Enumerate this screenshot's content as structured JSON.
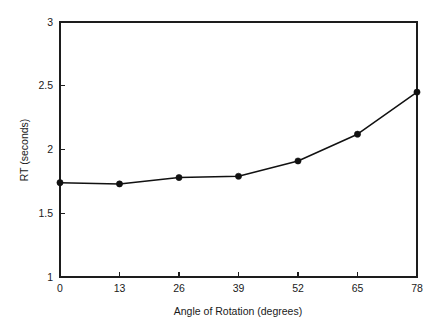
{
  "chart_data": {
    "type": "line",
    "title": "",
    "xlabel": "Angle of Rotation (degrees)",
    "ylabel": "RT (seconds)",
    "x": [
      0,
      13,
      26,
      39,
      52,
      65,
      78
    ],
    "values": [
      1.74,
      1.73,
      1.78,
      1.79,
      1.91,
      2.12,
      2.45
    ],
    "categories": [
      "0",
      "13",
      "26",
      "39",
      "52",
      "65",
      "78"
    ],
    "xlim": [
      0,
      78
    ],
    "ylim": [
      1,
      3
    ],
    "xticks": [
      0,
      13,
      26,
      39,
      52,
      65,
      78
    ],
    "xtick_labels": [
      "0",
      "13",
      "26",
      "39",
      "52",
      "65",
      "78"
    ],
    "yticks": [
      1,
      1.5,
      2,
      2.5,
      3
    ],
    "ytick_labels": [
      "1",
      "1.5",
      "2",
      "2.5",
      "3"
    ],
    "grid": false,
    "legend": "none",
    "marker": "filled-circle",
    "line_color": "#111111",
    "marker_color": "#111111",
    "axis_color": "#1d1d1d",
    "background_color": "#ffffff",
    "series": [
      {
        "name": "RT",
        "values": [
          1.74,
          1.73,
          1.78,
          1.79,
          1.91,
          2.12,
          2.45
        ]
      }
    ]
  },
  "figure": {
    "xlabel": "Angle of Rotation (degrees)",
    "ylabel": "RT (seconds)"
  }
}
